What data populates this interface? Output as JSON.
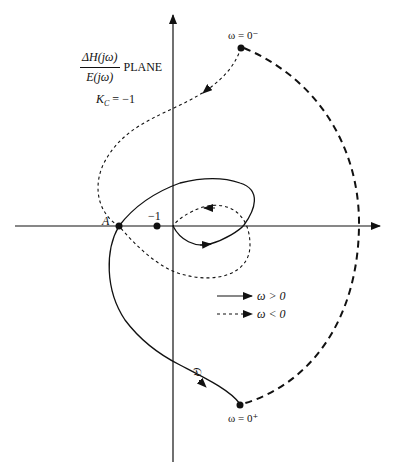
{
  "title": {
    "numerator": "ΔH(jω)",
    "denominator": "E(jω)",
    "suffix": "PLANE"
  },
  "gain_label": "K_C = −1",
  "gain": {
    "symbol": "K",
    "subscript": "C",
    "value": "= −1"
  },
  "points": {
    "A": "A",
    "minus_one": "−1",
    "omega_zero_minus": "ω = 0⁻",
    "omega_zero_plus": "ω = 0⁺"
  },
  "curve_label": "𝔇",
  "legend": [
    {
      "style": "solid",
      "label": "ω > 0"
    },
    {
      "style": "dashed",
      "label": "ω < 0"
    }
  ],
  "colors": {
    "ink": "#111111",
    "background": "#ffffff"
  }
}
